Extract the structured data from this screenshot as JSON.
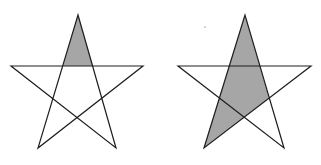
{
  "figure": {
    "width": 321,
    "height": 165,
    "background": "#ffffff",
    "stroke_color": "#1e1e1e",
    "fill_color": "#a6a6a6",
    "stars": [
      {
        "name": "left-star",
        "outline": "78,15 38,148 143,66 11,66 116,148",
        "shaded": "78,15 63,66 93,66"
      },
      {
        "name": "right-star",
        "outline": "245,15 204,148 311,66 178,66 284,148",
        "shaded": "245,15 204,148 269,98"
      }
    ],
    "speck": {
      "cx": 205,
      "cy": 27,
      "r": 0.7
    }
  }
}
